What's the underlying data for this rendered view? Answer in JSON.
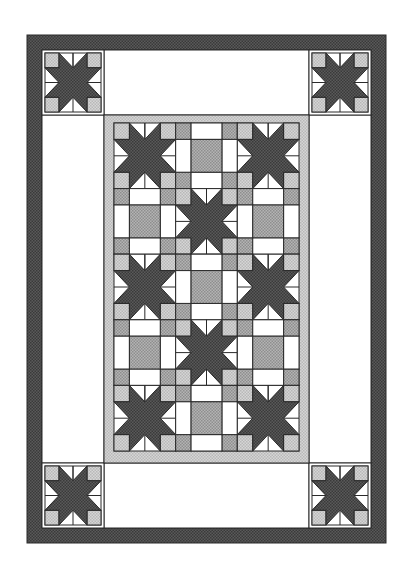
{
  "colors": {
    "outline": "#2a2a2a",
    "dark_fabric": "#5a5a5a",
    "dark_fabric_dots": "#3a3a3a",
    "medium_fabric": "#b4b4b4",
    "medium_fabric_dots": "#8e8e8e",
    "light_fabric": "#d6d6d6",
    "light_fabric_dots": "#b8b8b8",
    "white": "#ffffff"
  },
  "quilt": {
    "outer_border": {
      "fabric": "dark"
    },
    "corner_blocks": [
      {
        "name": "top-left",
        "type": "star"
      },
      {
        "name": "top-right",
        "type": "star"
      },
      {
        "name": "bottom-left",
        "type": "star"
      },
      {
        "name": "bottom-right",
        "type": "star"
      }
    ],
    "center_panel": {
      "border_fabric": "light",
      "columns": 3,
      "rows": 5,
      "layout": [
        [
          "star",
          "square",
          "star"
        ],
        [
          "square",
          "star",
          "square"
        ],
        [
          "star",
          "square",
          "star"
        ],
        [
          "square",
          "star",
          "square"
        ],
        [
          "star",
          "square",
          "star"
        ]
      ]
    }
  }
}
